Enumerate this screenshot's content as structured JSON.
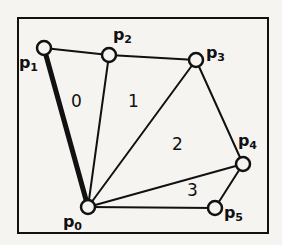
{
  "figure": {
    "background_color": "#f5f4f1",
    "ink_color": "#111111",
    "frame": {
      "name": "figure-border",
      "x": 18,
      "y": 18,
      "width": 250,
      "height": 215,
      "stroke_width": 2
    },
    "vertices": [
      {
        "id": "p0",
        "label": "p",
        "subscript": "0",
        "cx": 88,
        "cy": 207,
        "r": 7,
        "label_x": 63,
        "label_y": 214
      },
      {
        "id": "p1",
        "label": "p",
        "subscript": "1",
        "cx": 44,
        "cy": 48,
        "r": 7,
        "label_x": 19,
        "label_y": 55
      },
      {
        "id": "p2",
        "label": "p",
        "subscript": "2",
        "cx": 109,
        "cy": 55,
        "r": 7,
        "label_x": 113,
        "label_y": 27
      },
      {
        "id": "p3",
        "label": "p",
        "subscript": "3",
        "cx": 196,
        "cy": 60,
        "r": 7,
        "label_x": 206,
        "label_y": 45
      },
      {
        "id": "p4",
        "label": "p",
        "subscript": "4",
        "cx": 243,
        "cy": 164,
        "r": 7,
        "label_x": 238,
        "label_y": 133
      },
      {
        "id": "p5",
        "label": "p",
        "subscript": "5",
        "cx": 215,
        "cy": 208,
        "r": 7,
        "label_x": 224,
        "label_y": 205
      }
    ],
    "edges": [
      {
        "name": "edge-p0-p1",
        "from": "p0",
        "to": "p1",
        "x1": 88,
        "y1": 207,
        "x2": 44,
        "y2": 48,
        "stroke_width": 5,
        "highlighted": true
      },
      {
        "name": "edge-p1-p2",
        "from": "p1",
        "to": "p2",
        "x1": 44,
        "y1": 48,
        "x2": 109,
        "y2": 55,
        "stroke_width": 2,
        "highlighted": false
      },
      {
        "name": "edge-p2-p3",
        "from": "p2",
        "to": "p3",
        "x1": 109,
        "y1": 55,
        "x2": 196,
        "y2": 60,
        "stroke_width": 2,
        "highlighted": false
      },
      {
        "name": "edge-p0-p2",
        "from": "p0",
        "to": "p2",
        "x1": 88,
        "y1": 207,
        "x2": 109,
        "y2": 55,
        "stroke_width": 2,
        "highlighted": false
      },
      {
        "name": "edge-p0-p3",
        "from": "p0",
        "to": "p3",
        "x1": 88,
        "y1": 207,
        "x2": 196,
        "y2": 60,
        "stroke_width": 2,
        "highlighted": false
      },
      {
        "name": "edge-p3-p4",
        "from": "p3",
        "to": "p4",
        "x1": 196,
        "y1": 60,
        "x2": 243,
        "y2": 164,
        "stroke_width": 2,
        "highlighted": false
      },
      {
        "name": "edge-p0-p4",
        "from": "p0",
        "to": "p4",
        "x1": 88,
        "y1": 207,
        "x2": 243,
        "y2": 164,
        "stroke_width": 2,
        "highlighted": false
      },
      {
        "name": "edge-p4-p5",
        "from": "p4",
        "to": "p5",
        "x1": 243,
        "y1": 164,
        "x2": 215,
        "y2": 208,
        "stroke_width": 2,
        "highlighted": false
      },
      {
        "name": "edge-p0-p5",
        "from": "p0",
        "to": "p5",
        "x1": 88,
        "y1": 207,
        "x2": 215,
        "y2": 208,
        "stroke_width": 2,
        "highlighted": false
      }
    ],
    "faces": [
      {
        "id": "f0",
        "label": "0",
        "x": 71,
        "y": 93,
        "bounded_by": [
          "p0",
          "p1",
          "p2"
        ]
      },
      {
        "id": "f1",
        "label": "1",
        "x": 128,
        "y": 93,
        "bounded_by": [
          "p0",
          "p2",
          "p3"
        ]
      },
      {
        "id": "f2",
        "label": "2",
        "x": 172,
        "y": 136,
        "bounded_by": [
          "p0",
          "p3",
          "p4"
        ]
      },
      {
        "id": "f3",
        "label": "3",
        "x": 187,
        "y": 182,
        "bounded_by": [
          "p0",
          "p4",
          "p5"
        ]
      }
    ]
  }
}
